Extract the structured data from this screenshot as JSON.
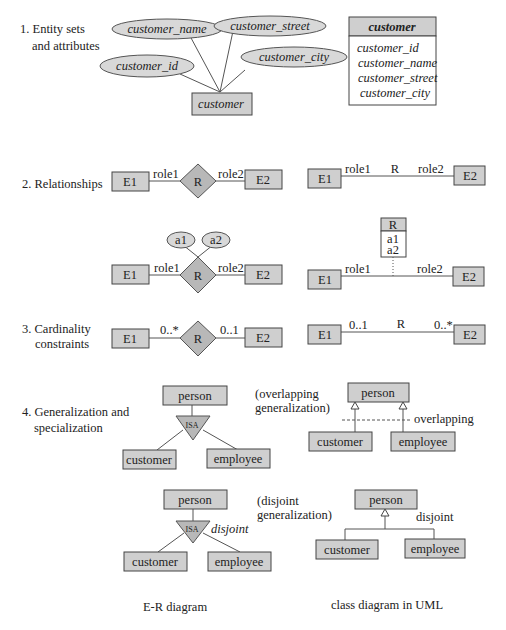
{
  "sections": {
    "s1": {
      "label_line1": "1. Entity sets",
      "label_line2": "and attributes"
    },
    "s2": {
      "label": "2. Relationships"
    },
    "s3": {
      "label_line1": "3. Cardinality",
      "label_line2": "constraints"
    },
    "s4": {
      "label_line1": "4. Generalization and",
      "label_line2": "specialization"
    }
  },
  "er_entity": {
    "entity": "customer",
    "attributes": [
      "customer_name",
      "customer_street",
      "customer_id",
      "customer_city"
    ]
  },
  "uml_entity": {
    "class_name": "customer",
    "attributes": [
      "customer_id",
      "customer_name",
      "customer_street",
      "customer_city"
    ]
  },
  "relationship": {
    "e1": "E1",
    "e2": "E2",
    "r": "R",
    "role1": "role1",
    "role2": "role2",
    "attr1": "a1",
    "attr2": "a2"
  },
  "cardinality": {
    "er_left": "0..*",
    "er_right": "0..1",
    "uml_left": "0..1",
    "uml_right": "0..*"
  },
  "generalization": {
    "parent": "person",
    "child1": "customer",
    "child2": "employee",
    "isa": "ISA",
    "overlapping_note_line1": "(overlapping",
    "overlapping_note_line2": "generalization)",
    "overlapping_label": "overlapping",
    "disjoint_note_line1": "(disjoint",
    "disjoint_note_line2": "generalization)",
    "disjoint_label": "disjoint"
  },
  "captions": {
    "left": "E-R diagram",
    "right": "class diagram in UML"
  }
}
